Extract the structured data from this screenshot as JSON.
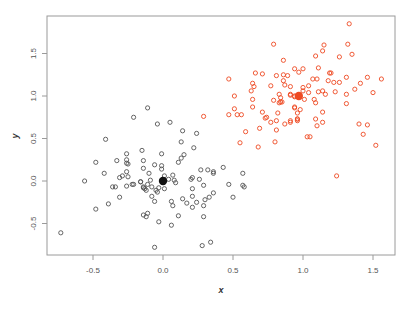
{
  "chart_data": {
    "type": "scatter",
    "title": "",
    "xlabel": "x",
    "ylabel": "y",
    "xlim": [
      -0.8,
      1.65
    ],
    "ylim": [
      -0.88,
      1.93
    ],
    "x_ticks": [
      -0.5,
      0.0,
      0.5,
      1.0,
      1.5
    ],
    "x_tick_labels": [
      "-0.5",
      "0.0",
      "0.5",
      "1.0",
      "1.5"
    ],
    "y_ticks": [
      -0.5,
      0.0,
      0.5,
      1.0,
      1.5
    ],
    "y_tick_labels": [
      "-0.5",
      "0.0",
      "0.5",
      "1.0",
      "1.5"
    ],
    "grid": false,
    "legend": null,
    "series": [
      {
        "name": "cluster-1",
        "color": "#555555",
        "marker": "open-circle",
        "centroid": [
          0.0,
          0.0
        ],
        "points": [
          [
            -0.73,
            -0.61
          ],
          [
            -0.56,
            0.0
          ],
          [
            -0.48,
            -0.33
          ],
          [
            -0.39,
            -0.27
          ],
          [
            -0.48,
            0.22
          ],
          [
            -0.42,
            0.09
          ],
          [
            -0.41,
            0.49
          ],
          [
            -0.21,
            0.75
          ],
          [
            -0.33,
            0.24
          ],
          [
            -0.31,
            0.04
          ],
          [
            -0.29,
            0.06
          ],
          [
            -0.36,
            -0.07
          ],
          [
            -0.34,
            -0.07
          ],
          [
            -0.31,
            -0.19
          ],
          [
            -0.26,
            0.32
          ],
          [
            -0.26,
            0.25
          ],
          [
            -0.26,
            0.21
          ],
          [
            -0.25,
            0.2
          ],
          [
            -0.26,
            0.11
          ],
          [
            -0.25,
            0.05
          ],
          [
            -0.26,
            -0.06
          ],
          [
            -0.22,
            -0.04
          ],
          [
            -0.21,
            -0.04
          ],
          [
            -0.16,
            -0.01
          ],
          [
            -0.15,
            0.36
          ],
          [
            -0.14,
            0.24
          ],
          [
            -0.14,
            0.15
          ],
          [
            -0.14,
            -0.08
          ],
          [
            -0.13,
            -0.09
          ],
          [
            -0.14,
            -0.4
          ],
          [
            -0.12,
            -0.42
          ],
          [
            -0.11,
            0.86
          ],
          [
            -0.04,
            0.67
          ],
          [
            0.05,
            0.69
          ],
          [
            0.14,
            0.59
          ],
          [
            0.24,
            0.56
          ],
          [
            0.13,
            0.46
          ],
          [
            0.22,
            0.39
          ],
          [
            -0.01,
            0.32
          ],
          [
            0.15,
            0.31
          ],
          [
            0.13,
            0.27
          ],
          [
            0.11,
            0.22
          ],
          [
            -0.06,
            0.19
          ],
          [
            -0.01,
            0.18
          ],
          [
            -0.01,
            0.14
          ],
          [
            -0.1,
            0.09
          ],
          [
            0.27,
            0.13
          ],
          [
            0.32,
            0.13
          ],
          [
            0.36,
            0.11
          ],
          [
            0.36,
            0.09
          ],
          [
            0.43,
            0.16
          ],
          [
            0.57,
            0.09
          ],
          [
            0.01,
            0.06
          ],
          [
            0.07,
            0.07
          ],
          [
            0.04,
            0.02
          ],
          [
            0.08,
            0.01
          ],
          [
            0.09,
            -0.02
          ],
          [
            0.21,
            0.04
          ],
          [
            0.2,
            0.02
          ],
          [
            0.26,
            0.02
          ],
          [
            -0.09,
            0.01
          ],
          [
            -0.16,
            -0.01
          ],
          [
            -0.11,
            -0.04
          ],
          [
            -0.14,
            -0.07
          ],
          [
            -0.12,
            -0.11
          ],
          [
            -0.08,
            -0.07
          ],
          [
            -0.05,
            -0.11
          ],
          [
            -0.03,
            -0.08
          ],
          [
            0.01,
            -0.09
          ],
          [
            -0.04,
            -0.13
          ],
          [
            0.29,
            -0.05
          ],
          [
            0.21,
            -0.09
          ],
          [
            0.47,
            -0.04
          ],
          [
            0.57,
            -0.05
          ],
          [
            0.58,
            -0.07
          ],
          [
            0.36,
            -0.14
          ],
          [
            -0.08,
            -0.18
          ],
          [
            -0.06,
            -0.24
          ],
          [
            0.21,
            -0.18
          ],
          [
            0.14,
            -0.21
          ],
          [
            0.06,
            -0.24
          ],
          [
            0.33,
            -0.19
          ],
          [
            0.3,
            -0.22
          ],
          [
            0.5,
            -0.19
          ],
          [
            0.17,
            -0.26
          ],
          [
            0.21,
            -0.31
          ],
          [
            0.24,
            -0.25
          ],
          [
            0.29,
            -0.29
          ],
          [
            0.07,
            -0.29
          ],
          [
            -0.11,
            -0.38
          ],
          [
            0.11,
            -0.41
          ],
          [
            0.29,
            -0.42
          ],
          [
            -0.03,
            -0.48
          ],
          [
            0.06,
            -0.52
          ],
          [
            -0.06,
            -0.78
          ],
          [
            0.28,
            -0.76
          ],
          [
            0.34,
            -0.72
          ]
        ]
      },
      {
        "name": "cluster-2",
        "color": "#ee4a22",
        "marker": "open-circle",
        "centroid": [
          0.97,
          1.0
        ],
        "points": [
          [
            0.79,
            1.61
          ],
          [
            0.86,
            1.42
          ],
          [
            0.47,
            1.2
          ],
          [
            0.66,
            1.27
          ],
          [
            0.71,
            1.26
          ],
          [
            0.81,
            1.24
          ],
          [
            0.86,
            1.25
          ],
          [
            0.89,
            1.24
          ],
          [
            0.94,
            1.32
          ],
          [
            0.97,
            1.28
          ],
          [
            0.86,
            1.18
          ],
          [
            0.87,
            1.13
          ],
          [
            0.64,
            1.15
          ],
          [
            0.65,
            1.11
          ],
          [
            0.77,
            1.12
          ],
          [
            0.91,
            1.11
          ],
          [
            0.63,
            1.06
          ],
          [
            0.51,
            1.0
          ],
          [
            0.83,
            1.02
          ],
          [
            0.84,
            0.98
          ],
          [
            0.91,
            1.02
          ],
          [
            0.64,
            0.96
          ],
          [
            0.79,
            0.95
          ],
          [
            0.84,
            0.93
          ],
          [
            0.83,
            0.92
          ],
          [
            0.85,
            0.93
          ],
          [
            0.94,
            0.99
          ],
          [
            0.51,
            0.85
          ],
          [
            0.64,
            0.87
          ],
          [
            0.94,
            0.86
          ],
          [
            0.96,
            0.8
          ],
          [
            0.29,
            0.76
          ],
          [
            0.47,
            0.78
          ],
          [
            0.53,
            0.78
          ],
          [
            0.56,
            0.78
          ],
          [
            0.71,
            0.81
          ],
          [
            0.74,
            0.75
          ],
          [
            0.73,
            0.74
          ],
          [
            0.82,
            0.8
          ],
          [
            0.77,
            0.69
          ],
          [
            0.81,
            0.71
          ],
          [
            0.87,
            0.67
          ],
          [
            0.91,
            0.69
          ],
          [
            0.96,
            0.73
          ],
          [
            0.69,
            0.62
          ],
          [
            0.59,
            0.58
          ],
          [
            0.81,
            0.6
          ],
          [
            0.55,
            0.45
          ],
          [
            0.68,
            0.4
          ],
          [
            0.8,
            0.46
          ],
          [
            1.33,
            1.85
          ],
          [
            1.32,
            1.61
          ],
          [
            1.35,
            1.49
          ],
          [
            1.15,
            1.6
          ],
          [
            1.14,
            1.53
          ],
          [
            1.09,
            1.47
          ],
          [
            1.26,
            1.46
          ],
          [
            1.0,
            1.32
          ],
          [
            1.11,
            1.33
          ],
          [
            1.19,
            1.27
          ],
          [
            1.2,
            1.27
          ],
          [
            1.07,
            1.2
          ],
          [
            1.1,
            1.2
          ],
          [
            1.18,
            1.18
          ],
          [
            1.22,
            1.16
          ],
          [
            1.26,
            1.16
          ],
          [
            1.31,
            1.22
          ],
          [
            1.46,
            1.22
          ],
          [
            1.56,
            1.2
          ],
          [
            1.41,
            1.15
          ],
          [
            1.0,
            1.1
          ],
          [
            1.04,
            1.12
          ],
          [
            1.0,
            1.06
          ],
          [
            1.04,
            1.04
          ],
          [
            1.11,
            1.05
          ],
          [
            1.14,
            1.06
          ],
          [
            1.16,
            1.02
          ],
          [
            1.23,
            1.05
          ],
          [
            1.31,
            1.02
          ],
          [
            1.37,
            1.08
          ],
          [
            1.5,
            1.04
          ],
          [
            0.91,
            1.01
          ],
          [
            0.94,
            1.0
          ],
          [
            1.01,
            0.96
          ],
          [
            1.08,
            0.96
          ],
          [
            1.09,
            0.92
          ],
          [
            1.31,
            0.91
          ],
          [
            0.94,
            0.87
          ],
          [
            0.98,
            0.84
          ],
          [
            1.14,
            0.81
          ],
          [
            0.91,
            0.71
          ],
          [
            0.96,
            0.73
          ],
          [
            0.96,
            0.71
          ],
          [
            1.09,
            0.73
          ],
          [
            1.14,
            0.69
          ],
          [
            1.1,
            0.65
          ],
          [
            1.4,
            0.67
          ],
          [
            1.46,
            0.66
          ],
          [
            1.43,
            0.55
          ],
          [
            1.03,
            0.52
          ],
          [
            1.05,
            0.52
          ],
          [
            1.52,
            0.42
          ],
          [
            1.24,
            0.06
          ]
        ]
      }
    ]
  }
}
